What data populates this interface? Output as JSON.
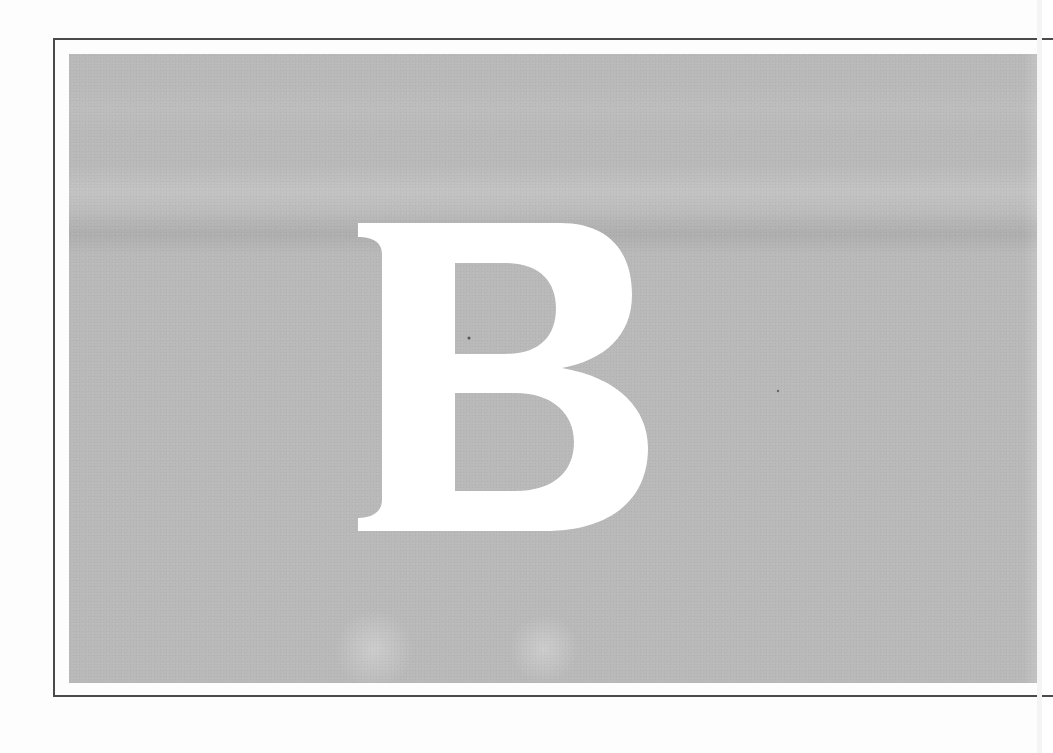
{
  "figure": {
    "letter": "B",
    "letter_color": "#ffffff",
    "panel_color": "#b9b9b9",
    "frame_color": "#4a4a4a",
    "page_color": "#fdfdfd"
  }
}
